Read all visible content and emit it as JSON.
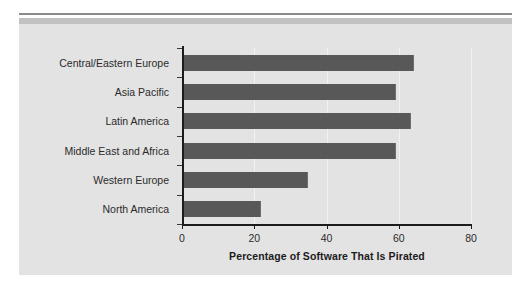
{
  "figure": {
    "panel_background": "#e3e3e3",
    "bar_color": "#585858",
    "axis_color": "#1c1c1c",
    "gridline_color": "#f2f2f2"
  },
  "chart_data": {
    "type": "bar",
    "orientation": "horizontal",
    "title": "",
    "subtitle": "",
    "xlabel": "Percentage of Software That Is Pirated",
    "ylabel": "",
    "xlim": [
      0,
      80
    ],
    "xticks": [
      0,
      20,
      40,
      60,
      80
    ],
    "xtick_labels": [
      "0",
      "20",
      "40",
      "60",
      "80"
    ],
    "grid": true,
    "grid_axis": "x",
    "legend": false,
    "legend_position": "none",
    "categories": [
      "Central/Eastern Europe",
      "Asia Pacific",
      "Latin America",
      "Middle East and Africa",
      "Western Europe",
      "North America"
    ],
    "values": [
      64,
      59,
      63,
      59,
      34.5,
      21.5
    ]
  }
}
